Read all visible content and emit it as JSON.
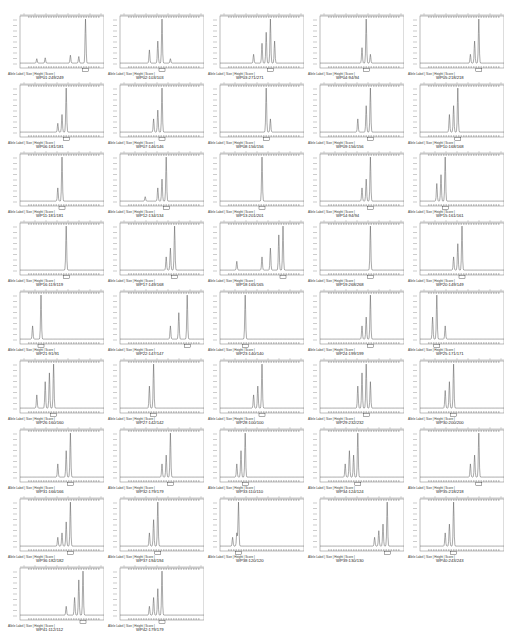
{
  "figure": {
    "label_row": "Allele Label  |  Size  |  Height  |  Score  |",
    "line_color": "#555555",
    "frame_color": "#777777",
    "bin_color": "#333333"
  },
  "chart_data": {
    "type": "line",
    "title": "",
    "xlabel": "",
    "ylabel": "",
    "grid": false,
    "panels": [
      {
        "caption": "WP01:249/249",
        "peak": 0.78,
        "peaks": [
          [
            0.2,
            0.1
          ],
          [
            0.3,
            0.12
          ],
          [
            0.6,
            0.18
          ],
          [
            0.7,
            0.15
          ],
          [
            0.78,
            1.0
          ]
        ]
      },
      {
        "caption": "WP02:103/103",
        "peak": 0.5,
        "peaks": [
          [
            0.35,
            0.3
          ],
          [
            0.45,
            0.5
          ],
          [
            0.5,
            1.0
          ],
          [
            0.6,
            0.1
          ]
        ]
      },
      {
        "caption": "WP03:271/271",
        "peak": 0.6,
        "peaks": [
          [
            0.4,
            0.2
          ],
          [
            0.5,
            0.45
          ],
          [
            0.55,
            0.7
          ],
          [
            0.6,
            1.0
          ],
          [
            0.65,
            0.5
          ]
        ]
      },
      {
        "caption": "WP04:94/94",
        "peak": 0.55,
        "peaks": [
          [
            0.5,
            0.35
          ],
          [
            0.55,
            1.0
          ],
          [
            0.6,
            0.2
          ]
        ]
      },
      {
        "caption": "WP05:218/218",
        "peak": 0.7,
        "peaks": [
          [
            0.6,
            0.2
          ],
          [
            0.65,
            0.5
          ],
          [
            0.7,
            1.0
          ]
        ]
      },
      {
        "caption": "WP06:181/181",
        "peak": 0.55,
        "peaks": [
          [
            0.45,
            0.2
          ],
          [
            0.5,
            0.4
          ],
          [
            0.55,
            1.0
          ]
        ]
      },
      {
        "caption": "WP07:146/146",
        "peak": 0.5,
        "peaks": [
          [
            0.4,
            0.3
          ],
          [
            0.45,
            0.5
          ],
          [
            0.5,
            1.0
          ]
        ]
      },
      {
        "caption": "WP08:156/156",
        "peak": 0.55,
        "peaks": [
          [
            0.55,
            1.0
          ],
          [
            0.6,
            0.3
          ]
        ]
      },
      {
        "caption": "WP09:156/156",
        "peak": 0.6,
        "peaks": [
          [
            0.45,
            0.3
          ],
          [
            0.55,
            0.6
          ],
          [
            0.6,
            1.0
          ]
        ]
      },
      {
        "caption": "WP10:168/168",
        "peak": 0.45,
        "peaks": [
          [
            0.35,
            0.4
          ],
          [
            0.4,
            0.6
          ],
          [
            0.45,
            1.0
          ]
        ]
      },
      {
        "caption": "WP11:181/181",
        "peak": 0.5,
        "peaks": [
          [
            0.45,
            0.3
          ],
          [
            0.5,
            1.0
          ]
        ]
      },
      {
        "caption": "WP12:134/134",
        "peak": 0.55,
        "peaks": [
          [
            0.3,
            0.1
          ],
          [
            0.45,
            0.3
          ],
          [
            0.5,
            0.5
          ],
          [
            0.55,
            1.0
          ]
        ]
      },
      {
        "caption": "WP13:201/201",
        "peak": 0.5,
        "peaks": [
          [
            0.5,
            1.0
          ]
        ]
      },
      {
        "caption": "WP14:94/94",
        "peak": 0.6,
        "peaks": [
          [
            0.5,
            0.3
          ],
          [
            0.55,
            0.5
          ],
          [
            0.6,
            1.0
          ]
        ]
      },
      {
        "caption": "WP15:161/161",
        "peak": 0.3,
        "peaks": [
          [
            0.2,
            0.4
          ],
          [
            0.25,
            0.6
          ],
          [
            0.3,
            1.0
          ]
        ]
      },
      {
        "caption": "WP16:119/119",
        "peak": 0.55,
        "peaks": [
          [
            0.55,
            1.0
          ]
        ]
      },
      {
        "caption": "WP17:149/168",
        "peak": 0.65,
        "peaks": [
          [
            0.55,
            0.3
          ],
          [
            0.6,
            0.5
          ],
          [
            0.65,
            1.0
          ]
        ]
      },
      {
        "caption": "WP18:165/165",
        "peak": 0.75,
        "peaks": [
          [
            0.2,
            0.2
          ],
          [
            0.5,
            0.3
          ],
          [
            0.6,
            0.5
          ],
          [
            0.7,
            0.8
          ],
          [
            0.75,
            1.0
          ]
        ]
      },
      {
        "caption": "WP19:268/268",
        "peak": 0.6,
        "peaks": [
          [
            0.6,
            1.0
          ]
        ]
      },
      {
        "caption": "WP20:149/149",
        "peak": 0.5,
        "peaks": [
          [
            0.4,
            0.3
          ],
          [
            0.45,
            0.6
          ],
          [
            0.5,
            1.0
          ]
        ]
      },
      {
        "caption": "WP21:91/91",
        "peak": 0.25,
        "peaks": [
          [
            0.15,
            0.3
          ],
          [
            0.25,
            1.0
          ]
        ]
      },
      {
        "caption": "WP22:147/147",
        "peak": 0.8,
        "peaks": [
          [
            0.6,
            0.3
          ],
          [
            0.7,
            0.6
          ],
          [
            0.8,
            1.0
          ]
        ]
      },
      {
        "caption": "WP23:140/140",
        "peak": 0.3,
        "peaks": [
          [
            0.3,
            1.0
          ]
        ]
      },
      {
        "caption": "WP24:199/199",
        "peak": 0.6,
        "peaks": [
          [
            0.5,
            0.3
          ],
          [
            0.55,
            0.5
          ],
          [
            0.6,
            1.0
          ]
        ]
      },
      {
        "caption": "WP25:171/171",
        "peak": 0.2,
        "peaks": [
          [
            0.15,
            0.5
          ],
          [
            0.2,
            1.0
          ],
          [
            0.3,
            0.3
          ]
        ]
      },
      {
        "caption": "WP26:160/160",
        "peak": 0.4,
        "peaks": [
          [
            0.2,
            0.3
          ],
          [
            0.3,
            0.6
          ],
          [
            0.35,
            0.8
          ],
          [
            0.4,
            1.0
          ]
        ]
      },
      {
        "caption": "WP27:142/142",
        "peak": 0.4,
        "peaks": [
          [
            0.35,
            0.5
          ],
          [
            0.4,
            1.0
          ]
        ]
      },
      {
        "caption": "WP28:100/100",
        "peak": 0.5,
        "peaks": [
          [
            0.4,
            0.3
          ],
          [
            0.45,
            0.5
          ],
          [
            0.5,
            1.0
          ]
        ]
      },
      {
        "caption": "WP29:232/232",
        "peak": 0.55,
        "peaks": [
          [
            0.45,
            0.5
          ],
          [
            0.5,
            0.8
          ],
          [
            0.55,
            1.0
          ],
          [
            0.6,
            0.6
          ]
        ]
      },
      {
        "caption": "WP30:200/200",
        "peak": 0.4,
        "peaks": [
          [
            0.3,
            0.4
          ],
          [
            0.35,
            0.6
          ],
          [
            0.4,
            1.0
          ]
        ]
      },
      {
        "caption": "WP31:166/166",
        "peak": 0.6,
        "peaks": [
          [
            0.45,
            0.3
          ],
          [
            0.55,
            0.6
          ],
          [
            0.6,
            1.0
          ]
        ]
      },
      {
        "caption": "WP32:179/179",
        "peak": 0.6,
        "peaks": [
          [
            0.5,
            0.3
          ],
          [
            0.55,
            0.5
          ],
          [
            0.6,
            1.0
          ]
        ]
      },
      {
        "caption": "WP33:110/110",
        "peak": 0.3,
        "peaks": [
          [
            0.2,
            0.3
          ],
          [
            0.25,
            0.6
          ],
          [
            0.3,
            1.0
          ]
        ]
      },
      {
        "caption": "WP34:124/124",
        "peak": 0.45,
        "peaks": [
          [
            0.3,
            0.3
          ],
          [
            0.35,
            0.6
          ],
          [
            0.4,
            0.5
          ],
          [
            0.45,
            1.0
          ]
        ]
      },
      {
        "caption": "WP35:218/218",
        "peak": 0.7,
        "peaks": [
          [
            0.6,
            0.3
          ],
          [
            0.65,
            0.5
          ],
          [
            0.7,
            1.0
          ]
        ]
      },
      {
        "caption": "WP36:182/182",
        "peak": 0.6,
        "peaks": [
          [
            0.45,
            0.2
          ],
          [
            0.5,
            0.3
          ],
          [
            0.55,
            0.55
          ],
          [
            0.6,
            1.0
          ]
        ]
      },
      {
        "caption": "WP37:194/194",
        "peak": 0.45,
        "peaks": [
          [
            0.35,
            0.3
          ],
          [
            0.4,
            0.6
          ],
          [
            0.45,
            1.0
          ]
        ]
      },
      {
        "caption": "WP38:120/120",
        "peak": 0.22,
        "peaks": [
          [
            0.15,
            0.2
          ],
          [
            0.2,
            0.3
          ],
          [
            0.22,
            1.0
          ]
        ]
      },
      {
        "caption": "WP39:130/130",
        "peak": 0.8,
        "peaks": [
          [
            0.65,
            0.2
          ],
          [
            0.7,
            0.35
          ],
          [
            0.75,
            0.5
          ],
          [
            0.8,
            1.0
          ]
        ]
      },
      {
        "caption": "WP40:243/243",
        "peak": 0.4,
        "peaks": [
          [
            0.3,
            0.3
          ],
          [
            0.35,
            0.5
          ],
          [
            0.4,
            1.0
          ]
        ]
      },
      {
        "caption": "WP41:112/112",
        "peak": 0.75,
        "peaks": [
          [
            0.55,
            0.2
          ],
          [
            0.65,
            0.4
          ],
          [
            0.7,
            0.8
          ],
          [
            0.75,
            1.0
          ]
        ]
      },
      {
        "caption": "WP42:179/179",
        "peak": 0.5,
        "peaks": [
          [
            0.35,
            0.2
          ],
          [
            0.4,
            0.4
          ],
          [
            0.45,
            0.6
          ],
          [
            0.5,
            1.0
          ]
        ]
      }
    ]
  }
}
